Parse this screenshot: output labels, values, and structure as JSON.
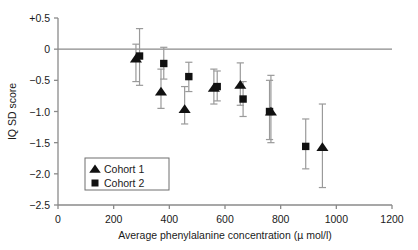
{
  "chart_data": {
    "type": "scatter",
    "title": "",
    "xlabel": "Average phenylalanine concentration (µ mol/l)",
    "ylabel": "IQ SD score",
    "xlim": [
      0,
      1200
    ],
    "ylim": [
      -2.5,
      0.5
    ],
    "xticks": [
      0,
      200,
      400,
      600,
      800,
      1000,
      1200
    ],
    "xticklabels": [
      "0",
      "200",
      "400",
      "600",
      "800",
      "1000",
      "1200"
    ],
    "yticks": [
      0.5,
      0,
      -0.5,
      -1.0,
      -1.5,
      -2.0,
      -2.5
    ],
    "yticklabels": [
      "+0.5",
      "0",
      "−0.5",
      "−1.0",
      "−1.5",
      "−2.0",
      "−2.5"
    ],
    "grid": false,
    "zero_line": 0,
    "legend_position": "lower-left-inside",
    "series": [
      {
        "name": "Cohort 1",
        "marker": "triangle",
        "color": "#111111",
        "points": [
          {
            "x": 280,
            "y": -0.15,
            "lo": -0.52,
            "hi": 0.08
          },
          {
            "x": 370,
            "y": -0.68,
            "lo": -0.95,
            "hi": -0.32
          },
          {
            "x": 455,
            "y": -0.96,
            "lo": -1.2,
            "hi": -0.6
          },
          {
            "x": 560,
            "y": -0.62,
            "lo": -0.88,
            "hi": -0.32
          },
          {
            "x": 655,
            "y": -0.57,
            "lo": -0.9,
            "hi": -0.22
          },
          {
            "x": 765,
            "y": -1.0,
            "lo": -1.5,
            "hi": -0.42
          },
          {
            "x": 950,
            "y": -1.57,
            "lo": -2.22,
            "hi": -0.88
          }
        ]
      },
      {
        "name": "Cohort 2",
        "marker": "square",
        "color": "#111111",
        "points": [
          {
            "x": 293,
            "y": -0.11,
            "lo": -0.58,
            "hi": 0.33
          },
          {
            "x": 380,
            "y": -0.23,
            "lo": -0.48,
            "hi": 0.03
          },
          {
            "x": 470,
            "y": -0.44,
            "lo": -0.68,
            "hi": -0.21
          },
          {
            "x": 572,
            "y": -0.6,
            "lo": -0.83,
            "hi": -0.35
          },
          {
            "x": 665,
            "y": -0.8,
            "lo": -1.08,
            "hi": -0.52
          },
          {
            "x": 760,
            "y": -1.0,
            "lo": -1.45,
            "hi": -0.5
          },
          {
            "x": 890,
            "y": -1.56,
            "lo": -1.92,
            "hi": -1.12
          }
        ]
      }
    ],
    "legend": [
      {
        "label": "Cohort 1",
        "marker": "triangle"
      },
      {
        "label": "Cohort 2",
        "marker": "square"
      }
    ]
  }
}
